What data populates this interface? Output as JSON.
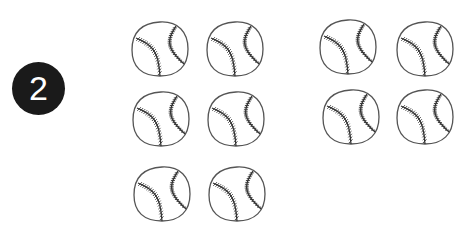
{
  "problem": {
    "number": "2"
  },
  "groups": [
    {
      "name": "left-group",
      "count": 6,
      "balls": [
        {
          "x": 130,
          "y": 20
        },
        {
          "x": 205,
          "y": 20
        },
        {
          "x": 131,
          "y": 90
        },
        {
          "x": 206,
          "y": 90
        },
        {
          "x": 132,
          "y": 165
        },
        {
          "x": 207,
          "y": 165
        }
      ]
    },
    {
      "name": "right-group",
      "count": 4,
      "balls": [
        {
          "x": 318,
          "y": 18
        },
        {
          "x": 395,
          "y": 20
        },
        {
          "x": 321,
          "y": 88
        },
        {
          "x": 395,
          "y": 88
        }
      ]
    }
  ],
  "item_icon": "baseball-icon",
  "colors": {
    "badge": "#1a1a1a",
    "badge_text": "#ffffff",
    "outline": "#555555",
    "stitches": "#333333"
  }
}
